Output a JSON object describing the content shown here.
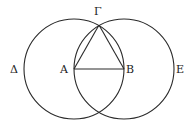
{
  "diagram": {
    "stroke_color": "#2a2a2a",
    "labels": {
      "gamma": "Γ",
      "alpha": "A",
      "beta": "B",
      "delta": "Δ",
      "epsilon": "E"
    },
    "points": {
      "A": [
        74,
        69
      ],
      "B": [
        124,
        69
      ],
      "Gamma": [
        99,
        25
      ]
    },
    "circles": [
      {
        "name": "circle-centered-A",
        "cx": 74,
        "cy": 69,
        "r": 50
      },
      {
        "name": "circle-centered-B",
        "cx": 124,
        "cy": 69,
        "r": 50
      }
    ]
  }
}
